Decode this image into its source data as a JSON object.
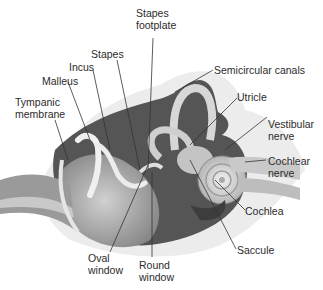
{
  "diagram": {
    "labels": {
      "stapes_footplate": [
        "Stapes",
        "footplate"
      ],
      "stapes": "Stapes",
      "incus": "Incus",
      "malleus": "Malleus",
      "tympanic_membrane": [
        "Tympanic",
        "membrane"
      ],
      "semicircular_canals": "Semicircular canals",
      "utricle": "Utricle",
      "vestibular_nerve": [
        "Vestibular",
        "nerve"
      ],
      "cochlear_nerve": [
        "Cochlear",
        "nerve"
      ],
      "cochlea": "Cochlea",
      "saccule": "Saccule",
      "oval_window": [
        "Oval",
        "window"
      ],
      "round_window": [
        "Round",
        "window"
      ]
    }
  }
}
